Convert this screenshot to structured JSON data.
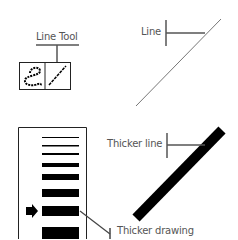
{
  "labels": {
    "line_tool": "Line Tool",
    "line": "Line",
    "thicker_line": "Thicker line",
    "thicker_drawing": "Thicker drawing"
  },
  "toolbox": {
    "tools": [
      {
        "name": "freehand-tool",
        "icon": "squiggle-icon"
      },
      {
        "name": "line-tool",
        "icon": "line-icon"
      }
    ]
  },
  "thickness_panel": {
    "options": [
      1,
      1.5,
      2,
      4,
      6,
      8,
      10,
      12
    ],
    "selected_index": 6
  },
  "colors": {
    "ink": "#000000",
    "callout": "#666666",
    "text": "#555555"
  }
}
